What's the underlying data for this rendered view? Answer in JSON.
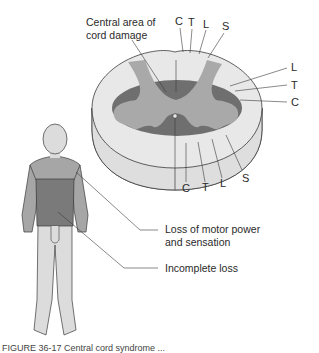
{
  "figure": {
    "cord": {
      "central_damage_label_line1": "Central area of",
      "central_damage_label_line2": "cord damage",
      "top_labels": [
        "C",
        "T",
        "L",
        "S"
      ],
      "right_labels": [
        "L",
        "T",
        "C"
      ],
      "bottom_labels": [
        "C",
        "T",
        "L",
        "S"
      ]
    },
    "body": {
      "motor_loss_line1": "Loss of motor power",
      "motor_loss_line2": "and sensation",
      "incomplete_loss": "Incomplete loss"
    },
    "caption": "FIGURE 36-17  Central cord syndrome ..."
  },
  "colors": {
    "white_matter": "#e6e6e6",
    "gray_matter": "#a9a9a9",
    "dark_region": "#6f6f6f",
    "body_incomplete": "#a6a6a6",
    "body_complete": "#7a7a7a",
    "body_legs": "#dcdcdc",
    "line": "#3a3a3a"
  }
}
